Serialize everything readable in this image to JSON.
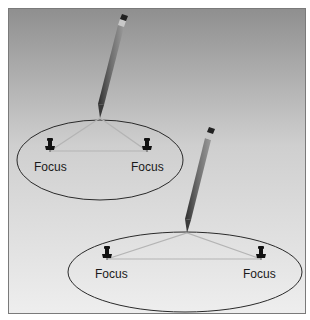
{
  "figure": {
    "panels": [
      {
        "id": "narrow-ellipse",
        "foci": [
          {
            "label": "Focus",
            "x": 50,
            "y": 150
          },
          {
            "label": "Focus",
            "x": 147,
            "y": 150
          }
        ],
        "ellipse": {
          "cx": 100,
          "cy": 160,
          "rx": 83,
          "ry": 40
        },
        "pencil_tip": {
          "x": 100,
          "y": 118
        },
        "pencil_end": {
          "x": 123,
          "y": 18
        }
      },
      {
        "id": "wide-ellipse",
        "foci": [
          {
            "label": "Focus",
            "x": 107,
            "y": 258
          },
          {
            "label": "Focus",
            "x": 261,
            "y": 258
          }
        ],
        "ellipse": {
          "cx": 185,
          "cy": 272,
          "rx": 117,
          "ry": 40
        },
        "pencil_tip": {
          "x": 187,
          "y": 233
        },
        "pencil_end": {
          "x": 210,
          "y": 131
        }
      }
    ]
  },
  "labels": {
    "focus_1": "Focus",
    "focus_2": "Focus",
    "focus_3": "Focus",
    "focus_4": "Focus"
  },
  "colors": {
    "background_top": "#8f8f8f",
    "background_bottom": "#ececec",
    "frame": "#7a7a7a",
    "ellipse_stroke": "#2a2a2a",
    "string": "#b0b0b0",
    "pin": "#111111",
    "pencil_body": "#555555",
    "pencil_eraser": "#222222",
    "pencil_ferrule": "#bdbdbd"
  }
}
